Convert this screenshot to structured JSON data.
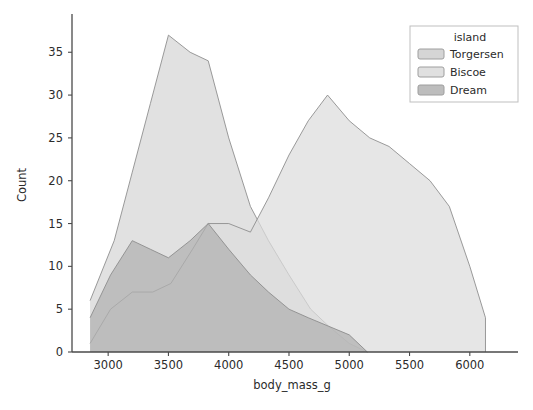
{
  "chart_data": {
    "type": "area",
    "title": "",
    "xlabel": "body_mass_g",
    "ylabel": "Count",
    "xlim": [
      2700,
      6350
    ],
    "ylim": [
      0,
      39
    ],
    "xticks": [
      3000,
      3500,
      4000,
      4500,
      5000,
      5500,
      6000
    ],
    "yticks": [
      0,
      5,
      10,
      15,
      20,
      25,
      30,
      35
    ],
    "grid": false,
    "legend": {
      "title": "island",
      "position": "upper-right",
      "entries": [
        "Torgersen",
        "Biscoe",
        "Dream"
      ]
    },
    "series": [
      {
        "name": "Torgersen",
        "color": "#d5d5d5",
        "points": [
          [
            2850,
            6
          ],
          [
            3050,
            13
          ],
          [
            3200,
            21
          ],
          [
            3350,
            29
          ],
          [
            3500,
            37
          ],
          [
            3680,
            35
          ],
          [
            3830,
            34
          ],
          [
            4000,
            25
          ],
          [
            4180,
            17
          ],
          [
            4330,
            13
          ],
          [
            4500,
            9
          ],
          [
            4680,
            5
          ],
          [
            4830,
            3
          ],
          [
            5000,
            1
          ],
          [
            5150,
            0
          ]
        ]
      },
      {
        "name": "Biscoe",
        "color": "#dcdcdc",
        "points": [
          [
            2850,
            1
          ],
          [
            3020,
            5
          ],
          [
            3200,
            7
          ],
          [
            3370,
            7
          ],
          [
            3520,
            8
          ],
          [
            3700,
            12
          ],
          [
            3830,
            15
          ],
          [
            4000,
            15
          ],
          [
            4180,
            14
          ],
          [
            4330,
            18
          ],
          [
            4500,
            23
          ],
          [
            4660,
            27
          ],
          [
            4820,
            30
          ],
          [
            5000,
            27
          ],
          [
            5170,
            25
          ],
          [
            5330,
            24
          ],
          [
            5500,
            22
          ],
          [
            5670,
            20
          ],
          [
            5830,
            17
          ],
          [
            6000,
            10
          ],
          [
            6130,
            4
          ],
          [
            6130,
            0
          ]
        ]
      },
      {
        "name": "Dream",
        "color": "#b0b0b0",
        "points": [
          [
            2850,
            4
          ],
          [
            3020,
            9
          ],
          [
            3200,
            13
          ],
          [
            3350,
            12
          ],
          [
            3500,
            11
          ],
          [
            3680,
            13
          ],
          [
            3830,
            15
          ],
          [
            4000,
            12
          ],
          [
            4180,
            9
          ],
          [
            4330,
            7
          ],
          [
            4500,
            5
          ],
          [
            4660,
            4
          ],
          [
            4830,
            3
          ],
          [
            5000,
            2
          ],
          [
            5150,
            0
          ]
        ]
      }
    ]
  },
  "axes": {
    "xlabel": "body_mass_g",
    "ylabel": "Count",
    "xtick_labels": [
      "3000",
      "3500",
      "4000",
      "4500",
      "5000",
      "5500",
      "6000"
    ],
    "ytick_labels": [
      "0",
      "5",
      "10",
      "15",
      "20",
      "25",
      "30",
      "35"
    ]
  },
  "legend": {
    "title": "island",
    "items": [
      {
        "label": "Torgersen",
        "swatch": "#d5d5d5"
      },
      {
        "label": "Biscoe",
        "swatch": "#e0e0e0"
      },
      {
        "label": "Dream",
        "swatch": "#bdbdbd"
      }
    ]
  },
  "style": {
    "background": "#ffffff",
    "axis_color": "#4a4a4a",
    "text_color": "#2b2b2b"
  }
}
